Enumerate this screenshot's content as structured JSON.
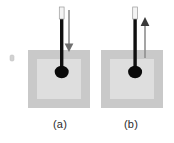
{
  "figure": {
    "background_color": "#ffffff",
    "panels": [
      {
        "id": "a",
        "label": "(a)",
        "arrow_direction": "down",
        "arrow_label": "",
        "substrate": {
          "outer_color": "#c9c9c9",
          "inner_color": "#dedede",
          "outer_x": 28,
          "outer_y": 50,
          "outer_w": 62,
          "outer_h": 58,
          "inner_x": 37,
          "inner_y": 59,
          "inner_w": 44,
          "inner_h": 40
        },
        "probe": {
          "shaft_color": "#101010",
          "cap_color": "#f2f2f2",
          "cap_outline_color": "#9a9a9a",
          "tip_color": "#0a0a0a",
          "x": 62,
          "cap_top": 7,
          "cap_bottom": 19,
          "shaft_bottom": 72,
          "tip_rx": 7,
          "tip_ry": 6
        },
        "arrow": {
          "color": "#8f8f8f",
          "x": 69,
          "start_y": 10,
          "end_y": 52
        }
      },
      {
        "id": "b",
        "label": "(b)",
        "arrow_direction": "up",
        "arrow_label": "",
        "substrate": {
          "outer_color": "#c9c9c9",
          "inner_color": "#dedede",
          "outer_x": 101,
          "outer_y": 50,
          "outer_w": 62,
          "outer_h": 58,
          "inner_x": 110,
          "inner_y": 59,
          "inner_w": 44,
          "inner_h": 40
        },
        "probe": {
          "shaft_color": "#101010",
          "cap_color": "#f2f2f2",
          "cap_outline_color": "#9a9a9a",
          "tip_color": "#0a0a0a",
          "x": 135,
          "cap_top": 7,
          "cap_bottom": 19,
          "shaft_bottom": 72,
          "tip_rx": 7,
          "tip_ry": 6
        },
        "arrow": {
          "color": "#8f8f8f",
          "x": 145,
          "start_y": 58,
          "end_y": 18
        }
      }
    ],
    "stray_mark": {
      "color": "#cfcfcf",
      "x": 10,
      "y": 55,
      "w": 4,
      "h": 6
    }
  }
}
